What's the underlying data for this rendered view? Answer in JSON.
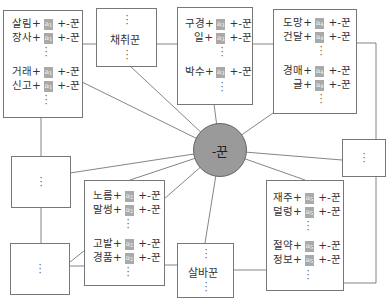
{
  "diagram": {
    "center": {
      "label": "-꾼"
    },
    "tag_prefix": "a",
    "boxes": {
      "a1": {
        "tag": "1",
        "rows": [
          {
            "stem": "살림+",
            "suffix": "+-꾼"
          },
          {
            "stem": "장사+",
            "suffix": "+-꾼"
          },
          {
            "stem": "거래+",
            "suffix": "+-꾼"
          },
          {
            "stem": "신고+",
            "suffix": "+-꾼"
          }
        ]
      },
      "chaechwi": {
        "label": "채취꾼"
      },
      "a3": {
        "tag": "3",
        "rows": [
          {
            "stem": "구경+",
            "suffix": "+-꾼"
          },
          {
            "stem": "일+",
            "suffix": "+-꾼"
          },
          {
            "stem": "박수+",
            "suffix": "+-꾼"
          }
        ]
      },
      "a4": {
        "tag": "4",
        "rows": [
          {
            "stem": "도망+",
            "suffix": "+-꾼"
          },
          {
            "stem": "건달+",
            "suffix": "+-꾼"
          },
          {
            "stem": "경매+",
            "suffix": "+-꾼"
          },
          {
            "stem": "글+",
            "suffix": "+-꾼"
          }
        ]
      },
      "a2": {
        "tag": "2",
        "rows": [
          {
            "stem": "노름+",
            "suffix": "+-꾼"
          },
          {
            "stem": "말썽+",
            "suffix": "+-꾼"
          },
          {
            "stem": "고발+",
            "suffix": "+-꾼"
          },
          {
            "stem": "경품+",
            "suffix": "+-꾼"
          }
        ]
      },
      "salba": {
        "label": "살바꾼"
      },
      "a5": {
        "tag": "5",
        "rows": [
          {
            "stem": "재주+",
            "suffix": "+-꾼"
          },
          {
            "stem": "덜렁+",
            "suffix": "+-꾼"
          },
          {
            "stem": "절약+",
            "suffix": "+-꾼"
          },
          {
            "stem": "정보+",
            "suffix": "+-꾼"
          }
        ]
      },
      "ellipsis_left_mid": {
        "label": "⋮"
      },
      "ellipsis_left_bottom": {
        "label": "⋮"
      },
      "ellipsis_right": {
        "label": "⋮"
      }
    },
    "colors": {
      "circle_fill": "#9a9a9a",
      "tag_fill": "#a9a9a9",
      "line": "#666666"
    }
  }
}
